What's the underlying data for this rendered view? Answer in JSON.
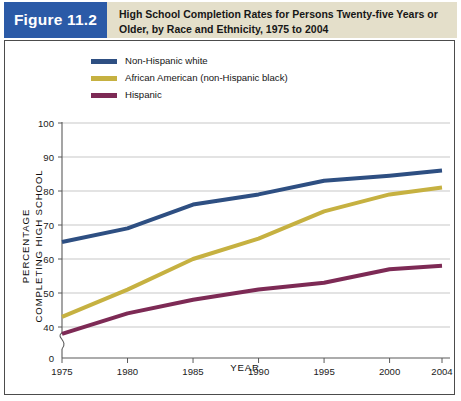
{
  "figure": {
    "badge_label": "Figure 11.2",
    "title_line1": "High School Completion Rates for Persons Twenty-five Years or",
    "title_line2": "Older, by Race and Ethnicity, 1975 to 2004",
    "badge_color": "#2b5aa7",
    "band_color": "#e4dfca"
  },
  "legend": {
    "items": [
      {
        "label": "Non-Hispanic white",
        "color": "#2e4f82"
      },
      {
        "label": "African American (non-Hispanic black)",
        "color": "#c6b141"
      },
      {
        "label": "Hispanic",
        "color": "#7d2a55"
      }
    ]
  },
  "axes": {
    "y_title_line1": "PERCENTAGE",
    "y_title_line2": "COMPLETING HIGH SCHOOL",
    "x_title": "YEAR",
    "y_ticks": [
      "100",
      "90",
      "80",
      "70",
      "60",
      "50",
      "40",
      "0"
    ],
    "x_ticks": [
      "1975",
      "1980",
      "1985",
      "1990",
      "1995",
      "2000",
      "2004"
    ],
    "has_axis_break": true
  },
  "chart_data": {
    "type": "line",
    "title": "High School Completion Rates for Persons Twenty-five Years or Older, by Race and Ethnicity, 1975 to 2004",
    "xlabel": "YEAR",
    "ylabel": "PERCENTAGE COMPLETING HIGH SCHOOL",
    "x": [
      1975,
      1980,
      1985,
      1990,
      1995,
      2000,
      2004
    ],
    "xlim": [
      1975,
      2004
    ],
    "ylim": [
      40,
      100
    ],
    "grid": true,
    "legend_position": "top-left",
    "series": [
      {
        "name": "Non-Hispanic white",
        "color": "#2e4f82",
        "values": [
          65,
          69,
          76,
          79,
          83,
          84.5,
          86
        ]
      },
      {
        "name": "African American (non-Hispanic black)",
        "color": "#c6b141",
        "values": [
          43,
          51,
          60,
          66,
          74,
          79,
          81
        ]
      },
      {
        "name": "Hispanic",
        "color": "#7d2a55",
        "values": [
          38,
          44,
          48,
          51,
          53,
          57,
          58
        ]
      }
    ]
  }
}
